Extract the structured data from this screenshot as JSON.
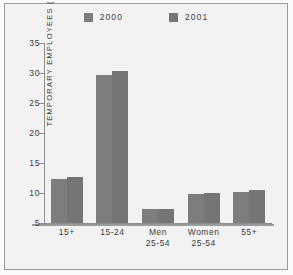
{
  "chart_data": {
    "type": "bar",
    "title": "",
    "xlabel": "",
    "ylabel": "TEMPORARY EMPLOYEES (%)",
    "categories": [
      "15+",
      "15-24",
      "Men\n25-54",
      "Women\n25-54",
      "55+"
    ],
    "series": [
      {
        "name": "2000",
        "color": "#7d7d7d",
        "values": [
          12.3,
          29.6,
          7.3,
          9.9,
          10.2
        ]
      },
      {
        "name": "2001",
        "color": "#757575",
        "values": [
          12.6,
          30.4,
          7.4,
          10.0,
          10.5
        ]
      }
    ],
    "ylim": [
      5,
      35
    ],
    "yticks": [
      5,
      10,
      15,
      20,
      25,
      30,
      35
    ],
    "ytick_labels": [
      "5",
      "10",
      "15",
      "20",
      "25",
      "30",
      "35"
    ],
    "grid": false,
    "legend_position": "top-center"
  },
  "legend": {
    "entries": [
      {
        "label": "2000",
        "swatch": "legend-swatch-2000"
      },
      {
        "label": "2001",
        "swatch": "legend-swatch-2001"
      }
    ]
  },
  "colors": {
    "series_2000": "#7d7d7d",
    "series_2001": "#757575",
    "axis": "#8e8e8e",
    "frame": "#9a9a9a",
    "background": "#f2f2f2",
    "text": "#3a3a3a"
  }
}
